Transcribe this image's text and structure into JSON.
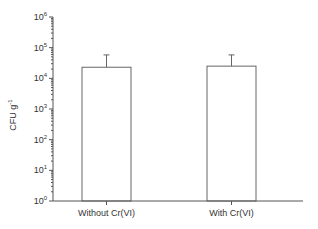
{
  "chart_data": {
    "type": "bar",
    "title": "",
    "xlabel": "",
    "ylabel": "CFU g",
    "ylabel_superscript": "-1",
    "yscale": "log",
    "ylim": [
      1,
      1000000
    ],
    "ytick_base": "10",
    "ytick_exponents": [
      "0",
      "1",
      "2",
      "3",
      "4",
      "5",
      "6"
    ],
    "categories": [
      "Without Cr(VI)",
      "With Cr(VI)"
    ],
    "values": [
      23000,
      25000
    ],
    "error_upper": [
      58000,
      58000
    ],
    "grid": false,
    "legend": "none"
  }
}
